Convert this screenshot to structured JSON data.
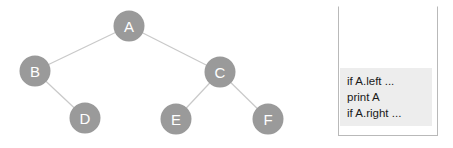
{
  "figure": {
    "background_color": "#ffffff",
    "node_color": "#9a9a9a",
    "node_label_color": "#ffffff",
    "edge_color": "#c9c9c9",
    "code_highlight_color": "#ededed",
    "code_text_color": "#1a1a1a",
    "panel_border_color": "#b9b9b9"
  },
  "tree": {
    "nodes": [
      {
        "id": "A",
        "label": "A",
        "cx": 129,
        "cy": 26,
        "r": 15.5
      },
      {
        "id": "B",
        "label": "B",
        "cx": 35,
        "cy": 71,
        "r": 15.5
      },
      {
        "id": "C",
        "label": "C",
        "cx": 220,
        "cy": 72,
        "r": 15.5
      },
      {
        "id": "D",
        "label": "D",
        "cx": 85,
        "cy": 118,
        "r": 15.5
      },
      {
        "id": "E",
        "label": "E",
        "cx": 176,
        "cy": 119,
        "r": 15.5
      },
      {
        "id": "F",
        "label": "F",
        "cx": 268,
        "cy": 119,
        "r": 15.5
      }
    ],
    "edges": [
      {
        "from": "A",
        "to": "B",
        "x1": 129,
        "y1": 26,
        "x2": 35,
        "y2": 71
      },
      {
        "from": "A",
        "to": "C",
        "x1": 129,
        "y1": 26,
        "x2": 220,
        "y2": 72
      },
      {
        "from": "B",
        "to": "D",
        "x1": 35,
        "y1": 71,
        "x2": 85,
        "y2": 118
      },
      {
        "from": "C",
        "to": "E",
        "x1": 220,
        "y1": 72,
        "x2": 176,
        "y2": 119
      },
      {
        "from": "C",
        "to": "F",
        "x1": 220,
        "y1": 72,
        "x2": 268,
        "y2": 119
      }
    ]
  },
  "code_panel": {
    "lines": [
      "if A.left ...",
      "print A",
      "if A.right ..."
    ]
  }
}
